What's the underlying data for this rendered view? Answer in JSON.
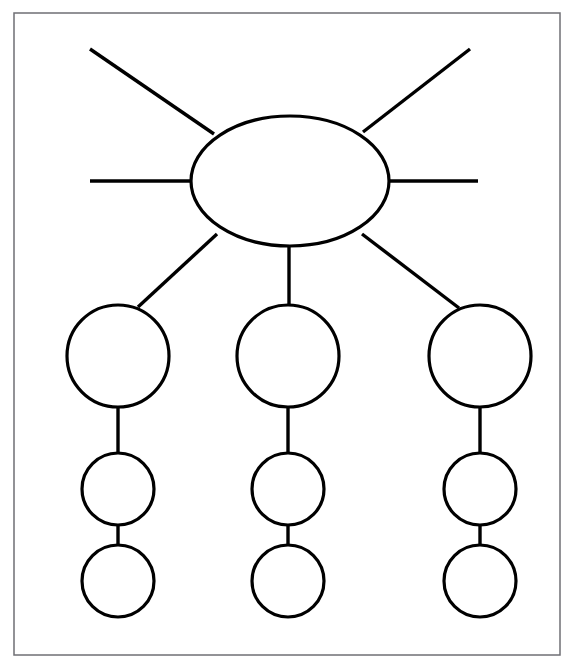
{
  "page": {
    "background_color": "#ffffff",
    "width": 576,
    "height": 661
  },
  "frame": {
    "name": "page-border",
    "x": 14,
    "y": 13,
    "width": 546,
    "height": 642,
    "stroke_color": "#6f6f74",
    "stroke_width": 1.5,
    "fill": "#ffffff"
  },
  "style": {
    "shape_stroke_color": "#000000",
    "shape_stroke_width": 3.2,
    "connector_stroke_color": "#000000",
    "connector_stroke_width": 3.4,
    "shape_fill": "#ffffff"
  },
  "chart_data": {
    "type": "diagram",
    "diagram_kind": "concept-map",
    "node_count": 10,
    "edge_count": 13,
    "nodes": [
      {
        "id": "center",
        "label": "",
        "shape": "ellipse",
        "cx": 290,
        "cy": 181,
        "rx": 99,
        "ry": 65,
        "level": 0,
        "role": "central-topic"
      },
      {
        "id": "branch-1-primary",
        "label": "",
        "shape": "circle",
        "cx": 118,
        "cy": 356,
        "r": 51,
        "level": 1,
        "role": "primary-idea",
        "column": 1
      },
      {
        "id": "branch-2-primary",
        "label": "",
        "shape": "circle",
        "cx": 288,
        "cy": 356,
        "r": 51,
        "level": 1,
        "role": "primary-idea",
        "column": 2
      },
      {
        "id": "branch-3-primary",
        "label": "",
        "shape": "circle",
        "cx": 480,
        "cy": 356,
        "r": 51,
        "level": 1,
        "role": "primary-idea",
        "column": 3
      },
      {
        "id": "branch-1-secondary",
        "label": "",
        "shape": "circle",
        "cx": 118,
        "cy": 489,
        "r": 36,
        "level": 2,
        "role": "supporting-detail",
        "column": 1
      },
      {
        "id": "branch-2-secondary",
        "label": "",
        "shape": "circle",
        "cx": 288,
        "cy": 489,
        "r": 36,
        "level": 2,
        "role": "supporting-detail",
        "column": 2
      },
      {
        "id": "branch-3-secondary",
        "label": "",
        "shape": "circle",
        "cx": 480,
        "cy": 489,
        "r": 36,
        "level": 2,
        "role": "supporting-detail",
        "column": 3
      },
      {
        "id": "branch-1-tertiary",
        "label": "",
        "shape": "circle",
        "cx": 118,
        "cy": 581,
        "r": 36,
        "level": 3,
        "role": "supporting-detail",
        "column": 1
      },
      {
        "id": "branch-2-tertiary",
        "label": "",
        "shape": "circle",
        "cx": 288,
        "cy": 581,
        "r": 36,
        "level": 3,
        "role": "supporting-detail",
        "column": 2
      },
      {
        "id": "branch-3-tertiary",
        "label": "",
        "shape": "circle",
        "cx": 480,
        "cy": 581,
        "r": 36,
        "level": 3,
        "role": "supporting-detail",
        "column": 3
      }
    ],
    "edges": [
      {
        "id": "spoke-upper-left",
        "from": "center",
        "to": null,
        "kind": "free-spoke",
        "x1": 214,
        "y1": 134,
        "x2": 90,
        "y2": 49
      },
      {
        "id": "spoke-upper-right",
        "from": "center",
        "to": null,
        "kind": "free-spoke",
        "x1": 363,
        "y1": 132,
        "x2": 470,
        "y2": 49
      },
      {
        "id": "spoke-left",
        "from": "center",
        "to": null,
        "kind": "free-spoke",
        "x1": 192,
        "y1": 181,
        "x2": 90,
        "y2": 181
      },
      {
        "id": "spoke-right",
        "from": "center",
        "to": null,
        "kind": "free-spoke",
        "x1": 389,
        "y1": 181,
        "x2": 478,
        "y2": 181
      },
      {
        "id": "edge-center-branch1",
        "from": "center",
        "to": "branch-1-primary",
        "kind": "branch",
        "x1": 217,
        "y1": 234,
        "x2": 138,
        "y2": 307
      },
      {
        "id": "edge-center-branch2",
        "from": "center",
        "to": "branch-2-primary",
        "kind": "branch",
        "x1": 289,
        "y1": 246,
        "x2": 289,
        "y2": 305
      },
      {
        "id": "edge-center-branch3",
        "from": "center",
        "to": "branch-3-primary",
        "kind": "branch",
        "x1": 362,
        "y1": 234,
        "x2": 459,
        "y2": 308
      },
      {
        "id": "edge-branch1-primary-secondary",
        "from": "branch-1-primary",
        "to": "branch-1-secondary",
        "kind": "chain",
        "x1": 118,
        "y1": 407,
        "x2": 118,
        "y2": 453
      },
      {
        "id": "edge-branch2-primary-secondary",
        "from": "branch-2-primary",
        "to": "branch-2-secondary",
        "kind": "chain",
        "x1": 288,
        "y1": 407,
        "x2": 288,
        "y2": 453
      },
      {
        "id": "edge-branch3-primary-secondary",
        "from": "branch-3-primary",
        "to": "branch-3-secondary",
        "kind": "chain",
        "x1": 480,
        "y1": 407,
        "x2": 480,
        "y2": 453
      },
      {
        "id": "edge-branch1-secondary-tertiary",
        "from": "branch-1-secondary",
        "to": "branch-1-tertiary",
        "kind": "chain",
        "x1": 118,
        "y1": 525,
        "x2": 118,
        "y2": 545
      },
      {
        "id": "edge-branch2-secondary-tertiary",
        "from": "branch-2-secondary",
        "to": "branch-2-tertiary",
        "kind": "chain",
        "x1": 288,
        "y1": 525,
        "x2": 288,
        "y2": 545
      },
      {
        "id": "edge-branch3-secondary-tertiary",
        "from": "branch-3-secondary",
        "to": "branch-3-tertiary",
        "kind": "chain",
        "x1": 480,
        "y1": 525,
        "x2": 480,
        "y2": 545
      }
    ]
  }
}
